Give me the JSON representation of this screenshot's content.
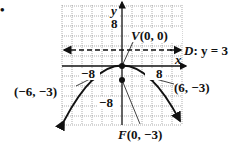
{
  "bullet": "•",
  "axes": {
    "x_label": "x",
    "y_label": "y",
    "tick_labels": {
      "x_neg": "−8",
      "x_pos": "8",
      "y_pos": "8",
      "y_neg": "−8"
    }
  },
  "labels": {
    "vertex": "V(0, 0)",
    "directrix": "D: y = 3",
    "focus": "F(0, −3)",
    "point_left": "(−6, −3)",
    "point_right": "(6, −3)"
  },
  "chart_data": {
    "type": "line",
    "title": "",
    "xlabel": "x",
    "ylabel": "y",
    "xlim": [
      -12,
      12
    ],
    "ylim": [
      -12,
      12
    ],
    "grid": true,
    "series": [
      {
        "name": "parabola x^2 = -12y",
        "equation": "y = -x^2/12"
      },
      {
        "name": "directrix",
        "equation": "y = 3",
        "style": "dashed"
      }
    ],
    "points": [
      {
        "label": "V(0, 0)",
        "x": 0,
        "y": 0
      },
      {
        "label": "F(0, −3)",
        "x": 0,
        "y": -3
      },
      {
        "label": "(−6, −3)",
        "x": -6,
        "y": -3
      },
      {
        "label": "(6, −3)",
        "x": 6,
        "y": -3
      }
    ],
    "tick_labels": [
      "−8",
      "8"
    ]
  }
}
